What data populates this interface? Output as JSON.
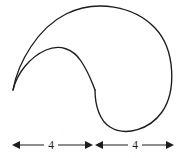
{
  "figure": {
    "background_color": "#ffffff",
    "stroke_color": "#1c1c1c",
    "width": 185,
    "height": 158,
    "shape": {
      "name": "cusped-closed-curve",
      "description": "Large outer lobe sweeping right and down, joined at a sharp cusp on the left to a smaller inner lobe, with an S-shaped interior boundary",
      "cusp_point": [
        13,
        90
      ],
      "outer_apex": [
        85,
        8
      ],
      "outer_right_extent": [
        171,
        66
      ],
      "outer_bottom": [
        133,
        131
      ],
      "inner_apex": [
        56,
        49
      ],
      "inflection_point": [
        95,
        90
      ]
    }
  },
  "dimensions": {
    "line_y": 145,
    "left_segment": {
      "label": "4",
      "from_x": 12,
      "to_x": 93,
      "label_x": 51,
      "start_arrow": "left-arrowhead",
      "end_arrow": "right-arrowhead"
    },
    "right_segment": {
      "label": "4",
      "from_x": 95,
      "to_x": 174,
      "label_x": 135,
      "start_arrow": "left-arrowhead",
      "end_arrow": "right-arrowhead"
    },
    "total_label": "8"
  }
}
